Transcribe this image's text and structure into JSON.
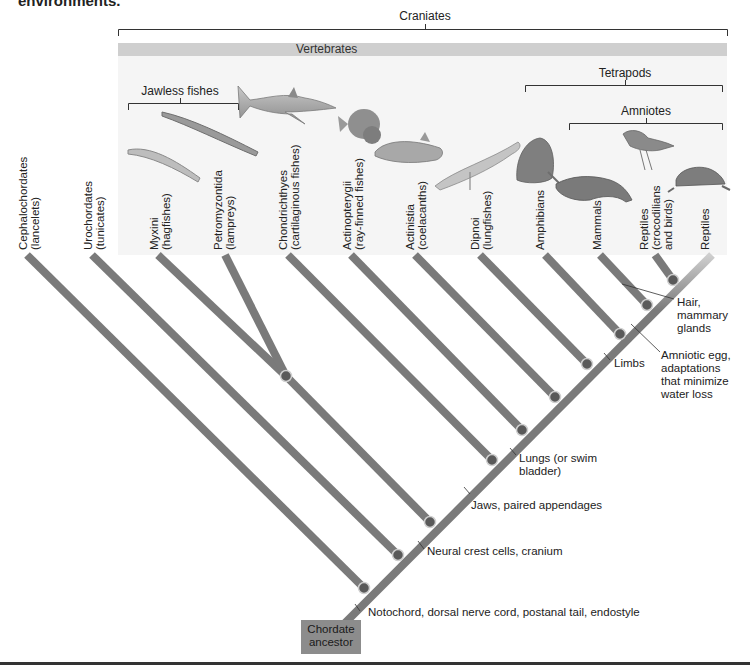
{
  "header_cut_text": "environments.",
  "groups": {
    "craniates": "Craniates",
    "vertebrates": "Vertebrates",
    "tetrapods": "Tetrapods",
    "amniotes": "Amniotes",
    "jawless_fishes": "Jawless fishes"
  },
  "taxa": [
    {
      "name": "Cephalochordates",
      "common": "(lancelets)"
    },
    {
      "name": "Urochordates",
      "common": "(tunicates)"
    },
    {
      "name": "Myxini",
      "common": "(hagfishes)"
    },
    {
      "name": "Petromyzontida",
      "common": "(lampreys)"
    },
    {
      "name": "Chondrichthyes",
      "common": "(cartilaginous fishes)"
    },
    {
      "name": "Actinopterygii",
      "common": "(ray-finned fishes)"
    },
    {
      "name": "Actinistia",
      "common": "(coelacanths)"
    },
    {
      "name": "Dipnoi",
      "common": "(lungfishes)"
    },
    {
      "name": "Amphibians",
      "common": ""
    },
    {
      "name": "Mammals",
      "common": ""
    },
    {
      "name": "Reptiles",
      "common": "(crocodilians",
      "extra": "and birds)"
    },
    {
      "name": "Reptiles",
      "common": ""
    }
  ],
  "characters": {
    "notochord": "Notochord, dorsal nerve cord, postanal tail, endostyle",
    "neural_crest": "Neural crest cells, cranium",
    "jaws": "Jaws, paired appendages",
    "lungs_1": "Lungs (or swim",
    "lungs_2": "bladder)",
    "limbs": "Limbs",
    "amniotic_1": "Amniotic egg,",
    "amniotic_2": "adaptations",
    "amniotic_3": "that minimize",
    "amniotic_4": "water loss",
    "hair_1": "Hair,",
    "hair_2": "mammary",
    "hair_3": "glands"
  },
  "ancestor": {
    "line1": "Chordate",
    "line2": "ancestor"
  },
  "colors": {
    "branch": "#7a7a7a",
    "node": "#5a5a5a",
    "band": "#cfcfcf",
    "panel": "#f5f5f5",
    "ancestor_box": "#8c8c8c"
  },
  "illustrations": [
    "hagfish",
    "lamprey",
    "shark",
    "ray-finned-fish",
    "coelacanth",
    "lungfish",
    "frog",
    "platypus",
    "bird",
    "tortoise"
  ]
}
